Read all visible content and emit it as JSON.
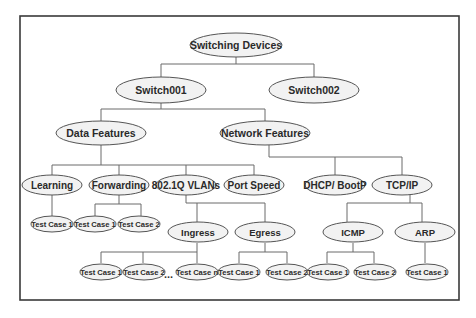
{
  "diagram": {
    "type": "tree",
    "root": "Switching Devices",
    "nodes": {
      "root": {
        "label": "Switching Devices"
      },
      "switch001": {
        "label": "Switch001"
      },
      "switch002": {
        "label": "Switch002"
      },
      "data_features": {
        "label": "Data Features"
      },
      "network_features": {
        "label": "Network Features"
      },
      "learning": {
        "label": "Learning"
      },
      "forwarding": {
        "label": "Forwarding"
      },
      "vlans": {
        "label": "802.1Q VLANs"
      },
      "port_speed": {
        "label": "Port Speed"
      },
      "dhcp": {
        "label": "DHCP/ BootP"
      },
      "tcpip": {
        "label": "TCP/IP"
      },
      "ingress": {
        "label": "Ingress"
      },
      "egress": {
        "label": "Egress"
      },
      "icmp": {
        "label": "ICMP"
      },
      "arp": {
        "label": "ARP"
      },
      "learning_tc1": {
        "label": "Test Case 1"
      },
      "forwarding_tc1": {
        "label": "Test Case 1"
      },
      "forwarding_tc2": {
        "label": "Test Case 2"
      },
      "ingress_tc1": {
        "label": "Test Case 1"
      },
      "ingress_tc2": {
        "label": "Test Case 2"
      },
      "ingress_tcn": {
        "label": "Test Case n"
      },
      "egress_tc1": {
        "label": "Test Case 1"
      },
      "egress_tc2": {
        "label": "Test Case 2"
      },
      "icmp_tc1": {
        "label": "Test Case 1"
      },
      "icmp_tc2": {
        "label": "Test Case 2"
      },
      "arp_tc1": {
        "label": "Test Case 1"
      }
    },
    "ellipsis": "...",
    "edges": [
      [
        "Switching Devices",
        "Switch001"
      ],
      [
        "Switching Devices",
        "Switch002"
      ],
      [
        "Switch001",
        "Data Features"
      ],
      [
        "Switch001",
        "Network Features"
      ],
      [
        "Data Features",
        "Learning"
      ],
      [
        "Data Features",
        "Forwarding"
      ],
      [
        "Data Features",
        "802.1Q VLANs"
      ],
      [
        "Data Features",
        "Port Speed"
      ],
      [
        "Network Features",
        "DHCP/ BootP"
      ],
      [
        "Network Features",
        "TCP/IP"
      ],
      [
        "Learning",
        "Test Case 1"
      ],
      [
        "Forwarding",
        "Test Case 1"
      ],
      [
        "Forwarding",
        "Test Case 2"
      ],
      [
        "802.1Q VLANs",
        "Ingress"
      ],
      [
        "802.1Q VLANs",
        "Egress"
      ],
      [
        "Ingress",
        "Test Case 1"
      ],
      [
        "Ingress",
        "Test Case 2"
      ],
      [
        "Ingress",
        "Test Case n"
      ],
      [
        "Egress",
        "Test Case 1"
      ],
      [
        "Egress",
        "Test Case 2"
      ],
      [
        "TCP/IP",
        "ICMP"
      ],
      [
        "TCP/IP",
        "ARP"
      ],
      [
        "ICMP",
        "Test Case 1"
      ],
      [
        "ICMP",
        "Test Case 2"
      ],
      [
        "ARP",
        "Test Case 1"
      ]
    ]
  }
}
